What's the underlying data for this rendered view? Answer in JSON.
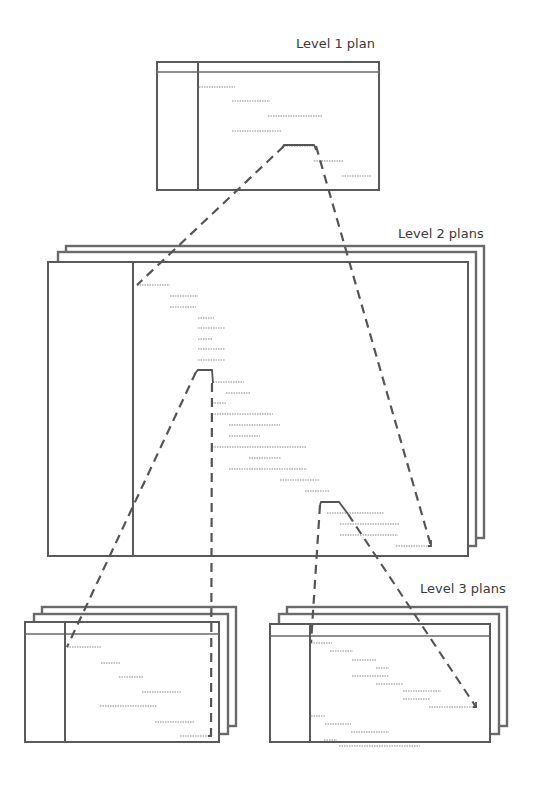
{
  "labels": {
    "level1": "Level 1 plan",
    "level2": "Level 2 plans",
    "level3": "Level 3 plans"
  },
  "diagram": {
    "type": "hierarchical-plan-decomposition",
    "nodes": [
      {
        "id": "level1",
        "label": "Level 1 plan",
        "stacked": false,
        "task_rows": 7
      },
      {
        "id": "level2",
        "label": "Level 2 plans",
        "stacked": true,
        "task_rows": 21
      },
      {
        "id": "level3a",
        "label": "Level 3 plans",
        "stacked": true,
        "task_rows": 7
      },
      {
        "id": "level3b",
        "label": "Level 3 plans",
        "stacked": true,
        "task_rows": 13
      }
    ],
    "edges": [
      {
        "from": "level1",
        "to": "level2",
        "style": "dashed",
        "meaning": "expands to"
      },
      {
        "from": "level2",
        "to": "level3a",
        "style": "dashed",
        "meaning": "expands to"
      },
      {
        "from": "level2",
        "to": "level3b",
        "style": "dashed",
        "meaning": "expands to"
      }
    ]
  }
}
